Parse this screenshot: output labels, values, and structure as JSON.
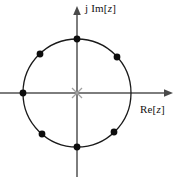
{
  "figure": {
    "width": 177,
    "height": 177,
    "background": "#ffffff"
  },
  "axes": {
    "imaginary": {
      "label_prefix": "j ",
      "label_func": "Im[",
      "label_var": "z",
      "label_suffix": "]",
      "label_full": "j Im[z]",
      "color": "#6b6b6b",
      "arrow": "up"
    },
    "real": {
      "label_prefix": "",
      "label_func": "Re[",
      "label_var": "z",
      "label_suffix": "]",
      "label_full": "Re[z]",
      "color": "#6b6b6b",
      "arrow": "right"
    },
    "origin_marker": {
      "name": "cross",
      "color": "#9a9a9a"
    }
  },
  "chart_data": {
    "type": "scatter",
    "title": "",
    "xlabel": "Re[z]",
    "ylabel": "j Im[z]",
    "xlim": [
      -1.45,
      1.45
    ],
    "ylim": [
      -1.45,
      1.45
    ],
    "grid": false,
    "legend": null,
    "center": {
      "x": 77,
      "y": 93
    },
    "radius_px": 54,
    "unit_circle": {
      "radius": 1,
      "stroke": "#1a1a1a",
      "stroke_width": 1.2
    },
    "origin": {
      "x": 0,
      "y": 0,
      "marker": "x",
      "color": "#9a9a9a"
    },
    "marker": {
      "shape": "filled-circle",
      "color": "#0d0d0d",
      "size_px": 5
    },
    "series": [
      {
        "name": "marked points on unit circle",
        "angles_deg": [
          42,
          90,
          133,
          180,
          230,
          270,
          314
        ],
        "points": [
          {
            "angle_deg": 42,
            "re": 0.743,
            "im": 0.669,
            "px": 117,
            "py": 57
          },
          {
            "angle_deg": 90,
            "re": 0.0,
            "im": 1.0,
            "px": 77,
            "py": 39
          },
          {
            "angle_deg": 133,
            "re": -0.682,
            "im": 0.731,
            "px": 40,
            "py": 54
          },
          {
            "angle_deg": 180,
            "re": -1.0,
            "im": 0.0,
            "px": 23,
            "py": 93
          },
          {
            "angle_deg": 230,
            "re": -0.643,
            "im": -0.766,
            "px": 42,
            "py": 134
          },
          {
            "angle_deg": 270,
            "re": 0.0,
            "im": -1.0,
            "px": 77,
            "py": 147
          },
          {
            "angle_deg": 314,
            "re": 0.695,
            "im": -0.719,
            "px": 114,
            "py": 132
          }
        ]
      }
    ],
    "missing_point": {
      "angle_deg": 0,
      "re": 1.0,
      "im": 0.0
    }
  }
}
